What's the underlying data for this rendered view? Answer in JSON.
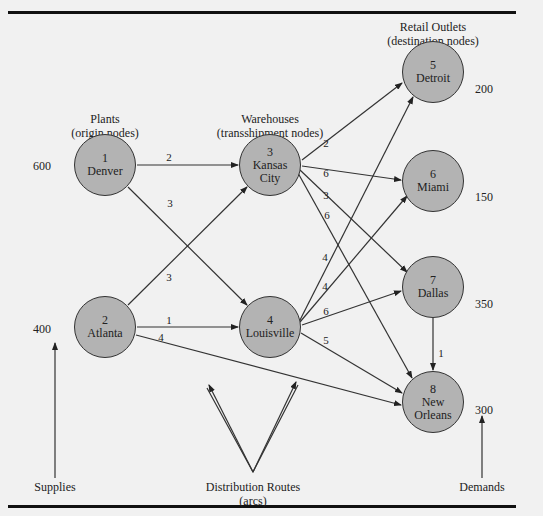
{
  "headers": {
    "plants": [
      "Plants",
      "(origin nodes)"
    ],
    "warehouses": [
      "Warehouses",
      "(transshipment nodes)"
    ],
    "retail": [
      "Retail Outlets",
      "(destination nodes)"
    ]
  },
  "nodes": [
    {
      "id": "1",
      "name": "Denver",
      "type": "origin",
      "value": "600"
    },
    {
      "id": "2",
      "name": "Atlanta",
      "type": "origin",
      "value": "400"
    },
    {
      "id": "3",
      "name": "Kansas City",
      "line1": "Kansas",
      "line2": "City",
      "type": "transshipment"
    },
    {
      "id": "4",
      "name": "Louisville",
      "type": "transshipment"
    },
    {
      "id": "5",
      "name": "Detroit",
      "type": "destination",
      "value": "200"
    },
    {
      "id": "6",
      "name": "Miami",
      "type": "destination",
      "value": "150"
    },
    {
      "id": "7",
      "name": "Dallas",
      "type": "destination",
      "value": "350"
    },
    {
      "id": "8",
      "name": "New Orleans",
      "line1": "New",
      "line2": "Orleans",
      "type": "destination",
      "value": "300"
    }
  ],
  "arcs": [
    {
      "from": "1",
      "to": "3",
      "cost": "2"
    },
    {
      "from": "1",
      "to": "4",
      "cost": "3"
    },
    {
      "from": "2",
      "to": "3",
      "cost": "3"
    },
    {
      "from": "2",
      "to": "4",
      "cost": "1"
    },
    {
      "from": "2",
      "to": "8",
      "cost": "4"
    },
    {
      "from": "3",
      "to": "5",
      "cost": "2"
    },
    {
      "from": "3",
      "to": "6",
      "cost": "6"
    },
    {
      "from": "3",
      "to": "7",
      "cost": "3"
    },
    {
      "from": "3",
      "to": "8",
      "cost": "6"
    },
    {
      "from": "4",
      "to": "5",
      "cost": "4"
    },
    {
      "from": "4",
      "to": "6",
      "cost": "4"
    },
    {
      "from": "4",
      "to": "7",
      "cost": "6"
    },
    {
      "from": "4",
      "to": "8",
      "cost": "5"
    },
    {
      "from": "7",
      "to": "8",
      "cost": "1"
    }
  ],
  "annotations": {
    "supplies": "Supplies",
    "routes": [
      "Distribution Routes",
      "(arcs)"
    ],
    "demands": "Demands"
  }
}
